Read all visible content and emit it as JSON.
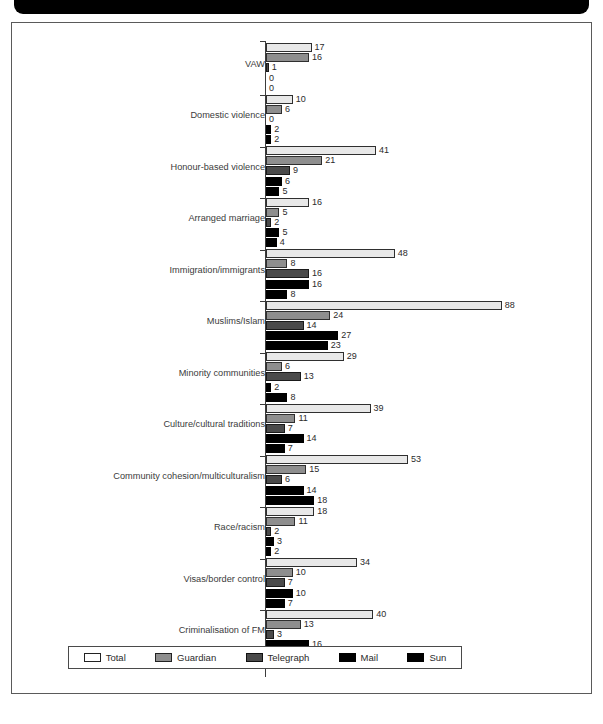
{
  "chart_data": {
    "type": "bar",
    "orientation": "horizontal",
    "title": "",
    "xlabel": "",
    "ylabel": "",
    "xlim": [
      0,
      88
    ],
    "grid": false,
    "legend_position": "bottom",
    "categories": [
      "VAW",
      "Domestic violence",
      "Honour-based violence",
      "Arranged marriage",
      "Immigration/immigrants",
      "Muslims/Islam",
      "Minority communities",
      "Culture/cultural traditions",
      "Community cohesion/multiculturalism",
      "Race/racism",
      "Visas/border control",
      "Criminalisation of FM"
    ],
    "series": [
      {
        "name": "Total",
        "color": "#e8e8e8",
        "values": [
          17,
          10,
          41,
          16,
          48,
          88,
          29,
          39,
          53,
          18,
          34,
          40
        ]
      },
      {
        "name": "Guardian",
        "color": "#8e8e8e",
        "values": [
          16,
          6,
          21,
          5,
          8,
          24,
          6,
          11,
          15,
          11,
          10,
          13
        ]
      },
      {
        "name": "Telegraph",
        "color": "#4a4a4a",
        "values": [
          1,
          0,
          9,
          2,
          16,
          14,
          13,
          7,
          6,
          2,
          7,
          3
        ]
      },
      {
        "name": "Mail",
        "color": "#000000",
        "values": [
          0,
          2,
          6,
          5,
          16,
          27,
          2,
          14,
          14,
          3,
          10,
          16
        ]
      },
      {
        "name": "Sun",
        "color": "#000000",
        "values": [
          0,
          2,
          5,
          4,
          8,
          23,
          8,
          7,
          18,
          2,
          7,
          8
        ]
      }
    ]
  },
  "legend": {
    "items": [
      {
        "label": "Total",
        "swatch": "legend-swatch-total"
      },
      {
        "label": "Guardian",
        "swatch": "legend-swatch-guardian"
      },
      {
        "label": "Telegraph",
        "swatch": "legend-swatch-telegraph"
      },
      {
        "label": "Mail",
        "swatch": "legend-swatch-mail"
      },
      {
        "label": "Sun",
        "swatch": "legend-swatch-sun"
      }
    ]
  }
}
